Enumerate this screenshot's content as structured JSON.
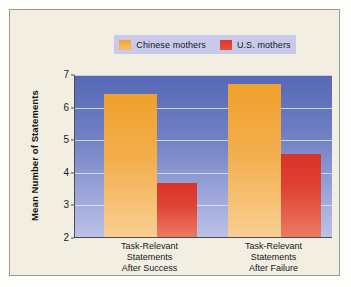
{
  "chart_data": {
    "type": "bar",
    "title": "",
    "subtitle": "",
    "xlabel": "",
    "ylabel": "Mean Number of Statements",
    "categories": [
      "Task-Relevant\nStatements\nAfter Success",
      "Task-Relevant\nStatements\nAfter Failure"
    ],
    "series": [
      {
        "name": "Chinese mothers",
        "color": "#f0a02b",
        "values": [
          6.4,
          6.7
        ]
      },
      {
        "name": "U.S. mothers",
        "color": "#d93229",
        "values": [
          3.65,
          4.55
        ]
      }
    ],
    "ylim": [
      2,
      7
    ],
    "yticks": [
      2,
      3,
      4,
      5,
      6,
      7
    ],
    "ytick_labels": [
      "2",
      "3",
      "4",
      "5",
      "6",
      "7"
    ],
    "grid": true,
    "legend_position": "top-center",
    "plot_background_top_color": "#5568b4",
    "plot_background_bottom_color": "#bcc1e6",
    "figure_background_color": "#f2efe2",
    "legend_background_color": "#c9caea"
  },
  "legend": {
    "items": [
      {
        "label": "Chinese mothers",
        "swatch": "orange"
      },
      {
        "label": "U.S. mothers",
        "swatch": "red"
      }
    ]
  }
}
